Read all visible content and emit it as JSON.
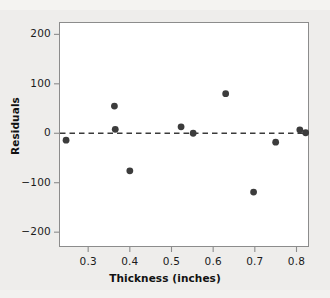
{
  "chart_data": {
    "type": "scatter",
    "title": "",
    "xlabel": "Thickness (inches)",
    "ylabel": "Residuals",
    "xlim": [
      0.23,
      0.83
    ],
    "ylim": [
      -230,
      225
    ],
    "xticks": [
      0.3,
      0.4,
      0.5,
      0.6,
      0.7,
      0.8
    ],
    "xtick_labels": [
      "0.3",
      "0.4",
      "0.5",
      "0.6",
      "0.7",
      "0.8"
    ],
    "yticks": [
      -200,
      -100,
      0,
      100,
      200
    ],
    "ytick_labels": [
      "−200",
      "−100",
      "0",
      "100",
      "200"
    ],
    "grid": false,
    "legend": null,
    "reference_line": {
      "y": 0,
      "style": "dashed",
      "color": "#3a3a3a"
    },
    "marker": {
      "shape": "circle",
      "color": "#3c3c3c",
      "size": 3.4
    },
    "points": [
      {
        "x": 0.247,
        "y": -14
      },
      {
        "x": 0.363,
        "y": 55
      },
      {
        "x": 0.365,
        "y": 8
      },
      {
        "x": 0.4,
        "y": -76
      },
      {
        "x": 0.523,
        "y": 13
      },
      {
        "x": 0.552,
        "y": 0
      },
      {
        "x": 0.63,
        "y": 80
      },
      {
        "x": 0.697,
        "y": -119
      },
      {
        "x": 0.75,
        "y": -18
      },
      {
        "x": 0.808,
        "y": 7
      },
      {
        "x": 0.822,
        "y": 1
      }
    ]
  },
  "colors": {
    "background": "#eeedeb",
    "plot_background": "#ffffff",
    "axis": "#8c8c8c",
    "text": "#1b1b1b",
    "marker": "#3c3c3c",
    "reference_line": "#3a3a3a"
  }
}
